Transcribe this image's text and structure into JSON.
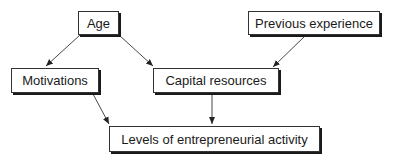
{
  "diagram": {
    "nodes": [
      {
        "id": "age",
        "label": "Age"
      },
      {
        "id": "previous_experience",
        "label": "Previous experience"
      },
      {
        "id": "motivations",
        "label": "Motivations"
      },
      {
        "id": "capital_resources",
        "label": "Capital resources"
      },
      {
        "id": "levels",
        "label": "Levels of entrepreneurial activity"
      }
    ],
    "edges": [
      {
        "from": "age",
        "to": "motivations"
      },
      {
        "from": "age",
        "to": "capital_resources"
      },
      {
        "from": "previous_experience",
        "to": "capital_resources"
      },
      {
        "from": "motivations",
        "to": "levels"
      },
      {
        "from": "capital_resources",
        "to": "levels"
      }
    ]
  }
}
